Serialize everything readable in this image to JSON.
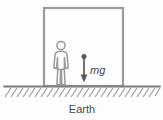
{
  "figure": {
    "background_color": "#fdfdfd",
    "stroke_color": "#8a8a8a",
    "text_color": "#4a4a4a",
    "labels": {
      "force": "mg",
      "ground": "Earth"
    },
    "box": {
      "name": "enclosure-rectangle",
      "x": 44,
      "y": 8,
      "width": 79,
      "height": 78,
      "stroke_width": 2.2
    },
    "person": {
      "name": "standing-person-pictogram",
      "center_x": 61,
      "head_center_y": 45,
      "head_radius": 4.2,
      "top_y": 40,
      "bottom_y": 85,
      "stroke_width": 1.4
    },
    "ground": {
      "name": "ground-line",
      "y": 86,
      "x_start": 4,
      "x_end": 160,
      "stroke_width": 1.6,
      "hatch_count": 26,
      "hatch_length": 12,
      "hatch_angle_deg": 55
    },
    "force_arrow": {
      "name": "weight-force-arrow",
      "x": 84,
      "tail_y": 57,
      "head_y": 82,
      "dot_radius": 2.4,
      "stroke_width": 1.6,
      "direction": "down",
      "label_x": 90,
      "label_y": 73
    },
    "earth_label": {
      "x": 82,
      "y": 112
    }
  }
}
